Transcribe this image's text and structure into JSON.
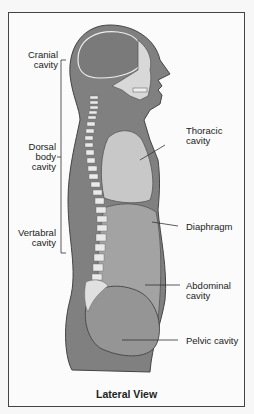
{
  "diagram": {
    "title": "Lateral View",
    "colors": {
      "body": "#808080",
      "cavity_light": "#c8c8c8",
      "cavity_mid": "#a3a3a3",
      "bone": "#e8e8e8",
      "outline": "#444444",
      "background": "#fbfbfb"
    },
    "left_labels": {
      "cranial": [
        "Cranial",
        "cavity"
      ],
      "dorsal": [
        "Dorsal",
        "body",
        "cavity"
      ],
      "vertebral": [
        "Vertabral",
        "cavity"
      ]
    },
    "right_labels": {
      "thoracic": [
        "Thoracic",
        "cavity"
      ],
      "diaphragm": [
        "Diaphragm"
      ],
      "abdominal": [
        "Abdominal",
        "cavity"
      ],
      "pelvic": [
        "Pelvic cavity"
      ]
    }
  }
}
